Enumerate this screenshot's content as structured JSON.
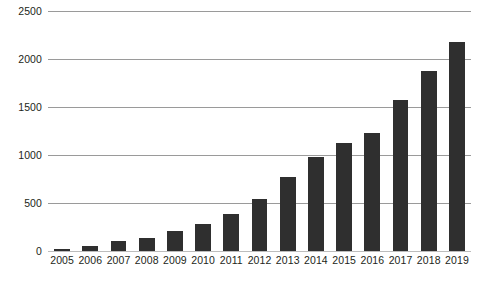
{
  "chart_data": {
    "type": "bar",
    "title": "",
    "subtitle": "",
    "xlabel": "",
    "ylabel": "",
    "categories": [
      "2005",
      "2006",
      "2007",
      "2008",
      "2009",
      "2010",
      "2011",
      "2012",
      "2013",
      "2014",
      "2015",
      "2016",
      "2017",
      "2018",
      "2019"
    ],
    "values": [
      20,
      55,
      100,
      140,
      205,
      280,
      385,
      540,
      770,
      975,
      1120,
      1225,
      1570,
      1880,
      2180
    ],
    "ylim": [
      0,
      2500
    ],
    "y_ticks": [
      0,
      500,
      1000,
      1500,
      2000,
      2500
    ],
    "y_tick_labels": [
      "0",
      "500",
      "1000",
      "1500",
      "2000",
      "2500"
    ],
    "grid": true,
    "legend": false,
    "legend_position": "none",
    "series": [
      {
        "name": "",
        "values": [
          20,
          55,
          100,
          140,
          205,
          280,
          385,
          540,
          770,
          975,
          1120,
          1225,
          1570,
          1880,
          2180
        ]
      }
    ],
    "colors": {
      "bar": "#2f2f2f",
      "gridline": "#9a9a9a",
      "baseline": "#bdbdbd",
      "text": "#231f20",
      "background": "#ffffff"
    }
  }
}
